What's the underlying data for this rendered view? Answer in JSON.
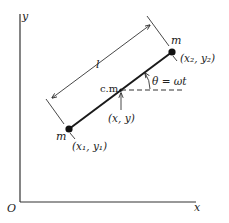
{
  "diagram": {
    "type": "physics-rigid-rotor",
    "axes": {
      "x_label": "x",
      "y_label": "y",
      "origin_label": "O"
    },
    "masses": [
      {
        "label": "m",
        "coords": "(x₁, y₁)"
      },
      {
        "label": "m",
        "coords": "(x₂, y₂)"
      }
    ],
    "center_of_mass": {
      "label": "c.m.",
      "coords": "(x, y)"
    },
    "length_label": "l",
    "angle_label": "θ = ωt",
    "colors": {
      "line": "#1a1a1a",
      "background": "#ffffff"
    }
  }
}
